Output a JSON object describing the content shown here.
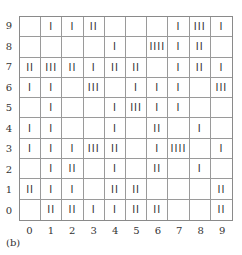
{
  "diagram": {
    "type": "tally-grid",
    "caption": "(b)",
    "x_labels": [
      "0",
      "1",
      "2",
      "3",
      "4",
      "5",
      "6",
      "7",
      "8",
      "9"
    ],
    "y_labels": [
      "9",
      "8",
      "7",
      "6",
      "5",
      "4",
      "3",
      "2",
      "1",
      "0"
    ],
    "rows": [
      {
        "y": "9",
        "cells": [
          "",
          "I",
          "I",
          "II",
          "",
          "",
          "",
          "I",
          "III",
          "I"
        ]
      },
      {
        "y": "8",
        "cells": [
          "",
          "",
          "",
          "",
          "I",
          "",
          "IIII",
          "I",
          "II",
          ""
        ]
      },
      {
        "y": "7",
        "cells": [
          "II",
          "III",
          "II",
          "I",
          "II",
          "II",
          "",
          "I",
          "II",
          "I"
        ]
      },
      {
        "y": "6",
        "cells": [
          "I",
          "I",
          "",
          "III",
          "",
          "I",
          "I",
          "I",
          "",
          "III"
        ]
      },
      {
        "y": "5",
        "cells": [
          "",
          "I",
          "",
          "",
          "I",
          "III",
          "I",
          "I",
          "",
          ""
        ]
      },
      {
        "y": "4",
        "cells": [
          "I",
          "I",
          "",
          "",
          "I",
          "",
          "II",
          "",
          "I",
          ""
        ]
      },
      {
        "y": "3",
        "cells": [
          "I",
          "I",
          "I",
          "III",
          "II",
          "",
          "I",
          "IIII",
          "",
          "I"
        ]
      },
      {
        "y": "2",
        "cells": [
          "",
          "I",
          "II",
          "",
          "I",
          "",
          "II",
          "",
          "I",
          ""
        ]
      },
      {
        "y": "1",
        "cells": [
          "II",
          "I",
          "I",
          "",
          "II",
          "II",
          "",
          "",
          "",
          "II"
        ]
      },
      {
        "y": "0",
        "cells": [
          "",
          "II",
          "II",
          "I",
          "I",
          "II",
          "II",
          "",
          "",
          "II"
        ]
      }
    ]
  }
}
